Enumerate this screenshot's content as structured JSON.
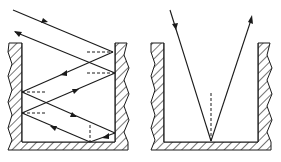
{
  "diagram": {
    "colors": {
      "line": "#1a1a1a",
      "background": "#ffffff",
      "hatch": "#1a1a1a"
    },
    "panels": [
      {
        "id": "multi-reflection-cavity",
        "walls": {
          "left_inner_x": 22,
          "right_inner_x": 115,
          "top_y": 43,
          "floor_y": 142
        },
        "rays": [
          {
            "from": [
              13,
              10
            ],
            "to": [
              113,
              52
            ]
          },
          {
            "from": [
              113,
              52
            ],
            "to": [
              22,
              92
            ]
          },
          {
            "from": [
              22,
              92
            ],
            "to": [
              115,
              133
            ]
          },
          {
            "from": [
              115,
              133
            ],
            "to": [
              90,
              142
            ]
          },
          {
            "from": [
              90,
              142
            ],
            "to": [
              22,
              113
            ]
          },
          {
            "from": [
              22,
              113
            ],
            "to": [
              115,
              73
            ]
          },
          {
            "from": [
              115,
              73
            ],
            "to": [
              15,
              32
            ]
          }
        ],
        "normals": [
          {
            "from": [
              87,
              52
            ],
            "to": [
              113,
              52
            ]
          },
          {
            "from": [
              87,
              73
            ],
            "to": [
              113,
              73
            ]
          },
          {
            "from": [
              22,
              92
            ],
            "to": [
              45,
              92
            ]
          },
          {
            "from": [
              22,
              113
            ],
            "to": [
              45,
              113
            ]
          },
          {
            "from": [
              90,
              125
            ],
            "to": [
              90,
              142
            ]
          }
        ]
      },
      {
        "id": "single-reflection-cavity",
        "walls": {
          "left_inner_x": 164,
          "right_inner_x": 258,
          "top_y": 43,
          "floor_y": 142
        },
        "rays": [
          {
            "from": [
              170,
              10
            ],
            "to": [
              211,
              141
            ]
          },
          {
            "from": [
              211,
              141
            ],
            "to": [
              252,
              16
            ]
          }
        ],
        "normals": [
          {
            "from": [
              211,
              93
            ],
            "to": [
              211,
              141
            ]
          }
        ]
      }
    ]
  }
}
